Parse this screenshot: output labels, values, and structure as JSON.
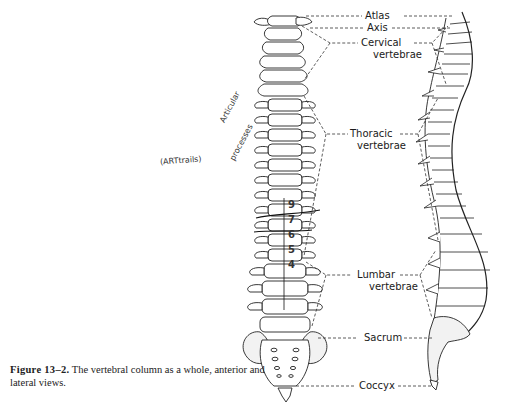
{
  "figure": {
    "caption_label": "Figure 13–2.",
    "caption_text": "The vertebral column as a whole, anterior and lateral views."
  },
  "labels": {
    "atlas": "Atlas",
    "axis": "Axis",
    "cervical_1": "Cervical",
    "cervical_2": "vertebrae",
    "thoracic_1": "Thoracic",
    "thoracic_2": "vertebrae",
    "lumbar_1": "Lumbar",
    "lumbar_2": "vertebrae",
    "sacrum": "Sacrum",
    "coccyx": "Coccyx"
  },
  "annotations": {
    "handwritten_1": "(ARTtrails)",
    "handwritten_2": "Articular",
    "handwritten_3": "processes",
    "vertebra_numbers": [
      "9",
      "7",
      "6",
      "5",
      "4"
    ]
  },
  "views": {
    "left": "anterior view",
    "right": "lateral view"
  },
  "colors": {
    "ink": "#1a1a1a",
    "paper": "#ffffff",
    "bone_shade": "#e6e6e6"
  }
}
